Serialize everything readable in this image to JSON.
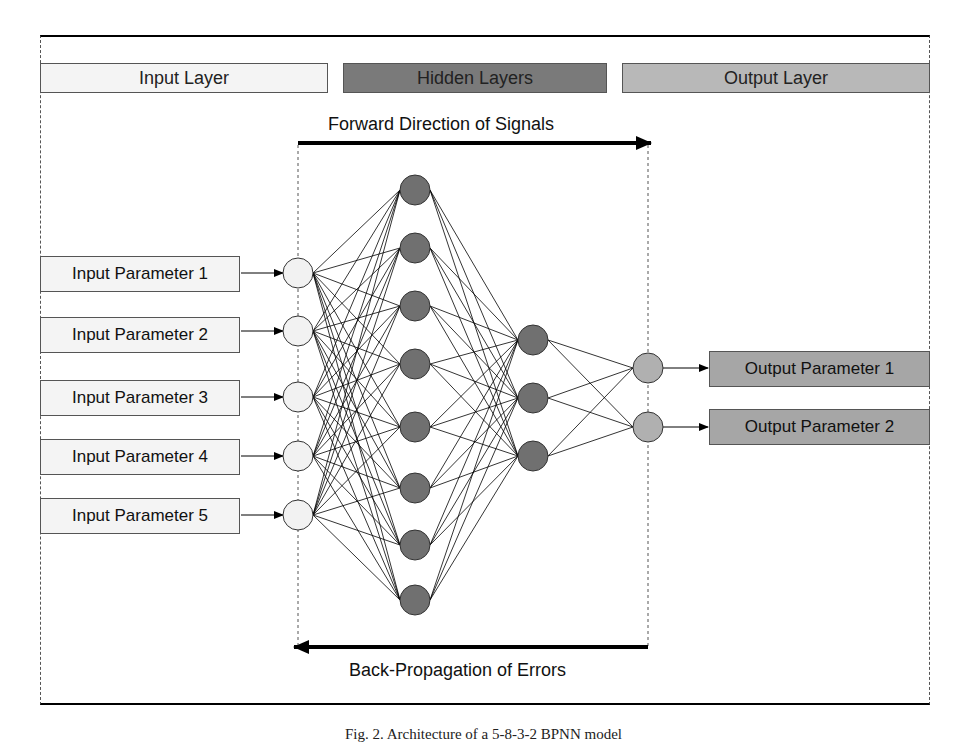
{
  "headers": {
    "input_layer": "Input Layer",
    "hidden_layers": "Hidden Layers",
    "output_layer": "Output Layer"
  },
  "arrows": {
    "forward": "Forward Direction of Signals",
    "backward": "Back-Propagation of Errors"
  },
  "inputs": [
    {
      "label": "Input Parameter 1"
    },
    {
      "label": "Input Parameter 2"
    },
    {
      "label": "Input Parameter 3"
    },
    {
      "label": "Input Parameter 4"
    },
    {
      "label": "Input Parameter 5"
    }
  ],
  "outputs": [
    {
      "label": "Output Parameter 1"
    },
    {
      "label": "Output Parameter 2"
    }
  ],
  "network": {
    "layers": [
      5,
      8,
      3,
      2
    ],
    "colors": {
      "input_node": "#f2f2f2",
      "hidden_node": "#707070",
      "output_node": "#b0b0b0",
      "input_header": "#f4f4f4",
      "hidden_header": "#7a7a7a",
      "output_header": "#b8b8b8"
    }
  },
  "caption": "Fig. 2.  Architecture of a 5-8-3-2 BPNN model"
}
